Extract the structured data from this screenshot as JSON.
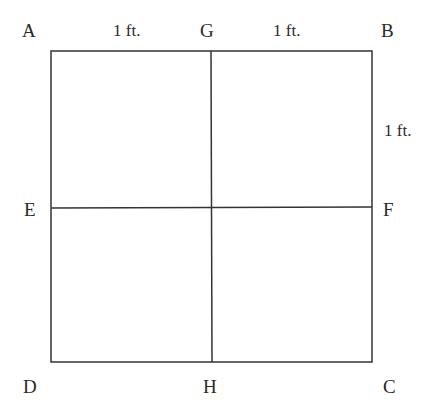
{
  "diagram": {
    "type": "square divided into four equal squares",
    "points": {
      "A": "A",
      "B": "B",
      "C": "C",
      "D": "D",
      "E": "E",
      "F": "F",
      "G": "G",
      "H": "H"
    },
    "dimensions": {
      "AG": "1 ft.",
      "GB": "1 ft.",
      "BF": "1 ft."
    },
    "line_color": "#333333"
  }
}
